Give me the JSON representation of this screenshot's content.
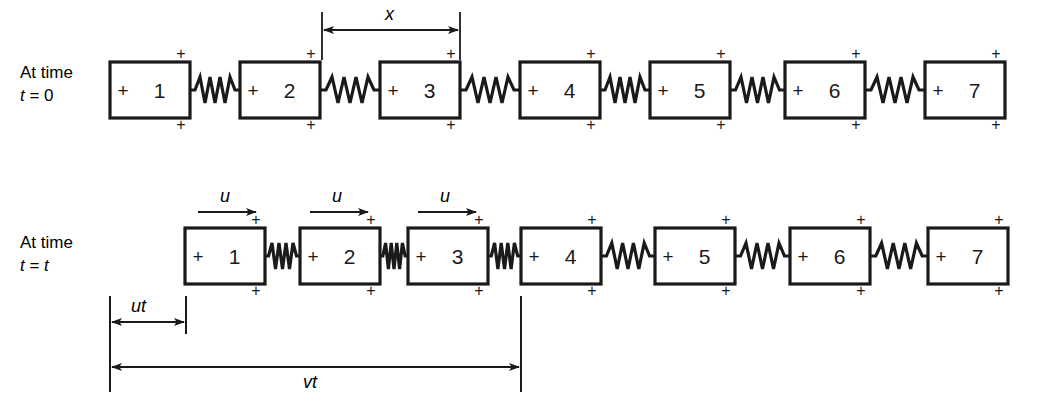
{
  "figure": {
    "stroke_color": "#1a1a1a",
    "background": "#ffffff"
  },
  "rows": [
    {
      "id": "row-t0",
      "label_line1": "At time",
      "label_line2_prefix": "t",
      "label_line2_rest": " = 0",
      "label_x": 20,
      "label_y": 62,
      "box_y": 62,
      "box_w": 80,
      "box_h": 56,
      "spring_style": "relaxed",
      "boxes": [
        {
          "n": "1",
          "x": 110
        },
        {
          "n": "2",
          "x": 240
        },
        {
          "n": "3",
          "x": 380
        },
        {
          "n": "4",
          "x": 520
        },
        {
          "n": "5",
          "x": 650
        },
        {
          "n": "6",
          "x": 785
        },
        {
          "n": "7",
          "x": 925
        }
      ]
    },
    {
      "id": "row-tt",
      "label_line1": "At time",
      "label_line2_prefix": "t",
      "label_line2_rest": " = t",
      "label_x": 20,
      "label_y": 232,
      "box_y": 228,
      "box_w": 80,
      "box_h": 56,
      "spring_style": "mixed",
      "boxes": [
        {
          "n": "1",
          "x": 185,
          "compressed_right": true
        },
        {
          "n": "2",
          "x": 300,
          "compressed_right": true
        },
        {
          "n": "3",
          "x": 408,
          "compressed_right": true
        },
        {
          "n": "4",
          "x": 521,
          "compressed_right": false
        },
        {
          "n": "5",
          "x": 655,
          "compressed_right": false
        },
        {
          "n": "6",
          "x": 790,
          "compressed_right": false
        },
        {
          "n": "7",
          "x": 928,
          "compressed_right": false
        }
      ]
    }
  ],
  "box_markers": {
    "inner_plus": "+",
    "corner_plus": "+"
  },
  "dimensions": [
    {
      "id": "x-dimension",
      "label": "x",
      "x1": 322,
      "x2": 460,
      "arrow_y": 30,
      "tick_top": 12,
      "tick_bottom": 60,
      "label_x": 385,
      "label_y": 4,
      "double_headed": true
    },
    {
      "id": "ut-dimension",
      "label": "ut",
      "x1": 110,
      "x2": 186,
      "arrow_y": 322,
      "tick_top": 296,
      "tick_bottom": 334,
      "label_x": 131,
      "label_y": 296,
      "double_headed": true
    },
    {
      "id": "vt-dimension",
      "label": "vt",
      "x1": 110,
      "x2": 521,
      "arrow_y": 367,
      "tick_top": 296,
      "tick_bottom": 392,
      "label_x": 303,
      "label_y": 372,
      "double_headed": true
    }
  ],
  "velocity_arrows": [
    {
      "id": "u-arrow-1",
      "label": "u",
      "x1": 198,
      "x2": 258,
      "y": 212,
      "label_x": 220,
      "label_y": 186
    },
    {
      "id": "u-arrow-2",
      "label": "u",
      "x1": 310,
      "x2": 370,
      "y": 212,
      "label_x": 332,
      "label_y": 186
    },
    {
      "id": "u-arrow-3",
      "label": "u",
      "x1": 418,
      "x2": 478,
      "y": 212,
      "label_x": 440,
      "label_y": 186
    }
  ],
  "extension_lines": [
    {
      "id": "vt-left-extension",
      "x": 110,
      "y1": 296,
      "y2": 392
    },
    {
      "id": "vt-right-extension",
      "x": 521,
      "y1": 296,
      "y2": 392
    },
    {
      "id": "ut-right-extension",
      "x": 186,
      "y1": 296,
      "y2": 334
    }
  ]
}
